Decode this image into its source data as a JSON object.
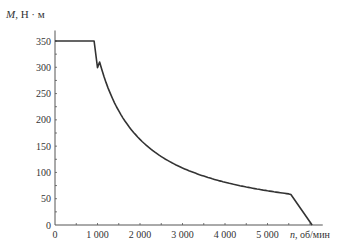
{
  "chart_data": {
    "type": "line",
    "title": "",
    "ylabel": "M, Н · м",
    "ylabel_italic_part": "M",
    "ylabel_rest": ", Н · м",
    "xlabel": "n, об/мин",
    "xlabel_italic_part": "n",
    "xlabel_rest": ", об/мин",
    "xlim": [
      0,
      6300
    ],
    "ylim": [
      0,
      370
    ],
    "x_ticks": [
      0,
      1000,
      2000,
      3000,
      4000,
      5000
    ],
    "x_tick_labels": [
      "0",
      "1 000",
      "2 000",
      "3 000",
      "4 000",
      "5 000"
    ],
    "x_minor_step": 500,
    "y_ticks": [
      0,
      50,
      100,
      150,
      200,
      250,
      300,
      350
    ],
    "y_tick_labels": [
      "0",
      "50",
      "100",
      "150",
      "200",
      "250",
      "300",
      "350"
    ],
    "y_minor_step": 25,
    "grid": false,
    "legend": null,
    "series": [
      {
        "name": "Torque M(n)",
        "color": "#333333",
        "x": [
          0,
          920,
          1000,
          1250,
          1500,
          1750,
          2000,
          2500,
          3000,
          3500,
          4000,
          4500,
          5000,
          5550,
          6050
        ],
        "y": [
          350,
          350,
          322,
          258,
          215,
          184,
          161,
          129,
          107,
          92,
          81,
          72,
          64,
          58,
          0
        ]
      }
    ]
  }
}
